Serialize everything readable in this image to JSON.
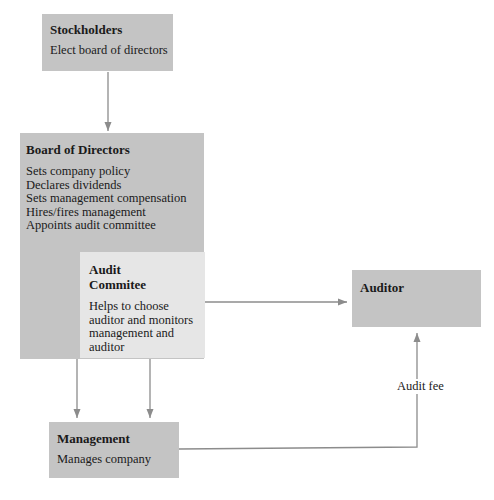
{
  "stockholders": {
    "title": "Stockholders",
    "description": "Elect board of directors"
  },
  "board": {
    "title": "Board of Directors",
    "duties": [
      "Sets company policy",
      "Declares dividends",
      "Sets management compensation",
      "Hires/fires management",
      "Appoints audit committee"
    ]
  },
  "audit_committee": {
    "title_line1": "Audit",
    "title_line2": "Commitee",
    "description_lines": [
      "Helps to choose",
      "auditor and monitors",
      "management and",
      "auditor"
    ]
  },
  "auditor": {
    "title": "Auditor"
  },
  "management": {
    "title": "Management",
    "description": "Manages company"
  },
  "edges": {
    "audit_fee_label": "Audit fee"
  },
  "colors": {
    "box_dark": "#c4c4c4",
    "box_light": "#e6e6e6",
    "arrow": "#8c8c8c"
  }
}
